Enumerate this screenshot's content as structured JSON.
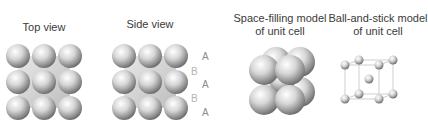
{
  "panels": {
    "top_view": {
      "title": "Top view"
    },
    "side_view": {
      "title": "Side view",
      "layer_labels": [
        "A",
        "B",
        "A",
        "B",
        "A"
      ]
    },
    "space_filling": {
      "title_line1": "Space-filling model",
      "title_line2": "of unit cell"
    },
    "ball_and_stick": {
      "title_line1": "Ball-and-stick model",
      "title_line2": "of unit cell"
    }
  },
  "colors": {
    "sphere_light": "#ffffff",
    "sphere_mid": "#c8c8c8",
    "sphere_dark": "#6e6e6e",
    "stick": "#cfcfcf",
    "text": "#3a3a3a"
  }
}
